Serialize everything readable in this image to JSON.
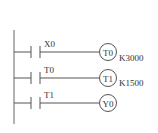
{
  "diagram": {
    "type": "ladder-logic",
    "colors": {
      "line": "#555555",
      "text": "#333333",
      "background": "#ffffff"
    },
    "rungs": [
      {
        "contact": "X0",
        "coil": "T0",
        "constant": "K3000"
      },
      {
        "contact": "T0",
        "coil": "T1",
        "constant": "K1500"
      },
      {
        "contact": "T1",
        "coil": "Y0",
        "constant": ""
      }
    ]
  }
}
